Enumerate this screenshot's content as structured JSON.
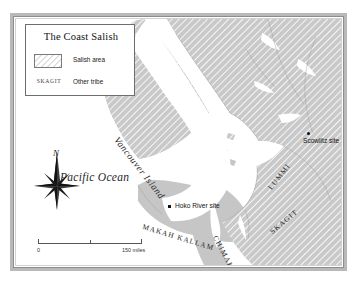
{
  "figure": {
    "kind": "historical-reference-map",
    "title": "The Coast Salish"
  },
  "legend": {
    "title": "The Coast Salish",
    "rows": [
      {
        "swatch": "hatched",
        "key": "",
        "label": "Salish area"
      },
      {
        "swatch": "none",
        "key": "SKAGIT",
        "label": "Other tribe"
      }
    ]
  },
  "compass": {
    "north_label": "N",
    "icon": "compass-rose-icon"
  },
  "scale": {
    "start_label": "0",
    "end_label": "150 miles",
    "unit": "miles",
    "max": 150
  },
  "ocean_label": "Pacific Ocean",
  "island_label": "Vancouver Island",
  "tribes": [
    {
      "name": "LUMMI",
      "rotation": -52
    },
    {
      "name": "SKAGIT",
      "rotation": -40
    },
    {
      "name": "MAKAH KALLAM",
      "rotation": 17
    },
    {
      "name": "CHIMAKUM",
      "rotation": 62
    }
  ],
  "sites": [
    {
      "name": "Scowlitz site",
      "marker": "round-dot"
    },
    {
      "name": "Hoko River site",
      "marker": "square-dot"
    }
  ],
  "colors": {
    "land": "#c6c6c6",
    "land_hatch": "#ffffff",
    "water": "#ffffff",
    "frame": "#b9b9b9",
    "frame_line": "#8d8d8d",
    "text": "#2b2b2b",
    "legend_bg": "#ffffff",
    "legend_border": "#6e6e6e"
  }
}
